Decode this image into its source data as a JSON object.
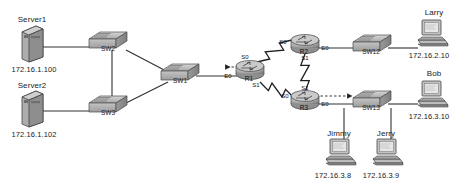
{
  "diagram": {
    "background_color": "#ffffff",
    "device_fill": "#b9b9b9",
    "device_stroke": "#4a4a4a",
    "link_color": "#303030"
  },
  "servers": [
    {
      "id": "server1",
      "name": "Server1",
      "ip": "172.16.1.100",
      "x": 32,
      "y": 44
    },
    {
      "id": "server2",
      "name": "Server2",
      "ip": "172.16.1.102",
      "x": 32,
      "y": 109
    }
  ],
  "switches": [
    {
      "id": "sw2",
      "name": "SW2",
      "x": 108,
      "y": 42
    },
    {
      "id": "sw3",
      "name": "SW3",
      "x": 108,
      "y": 106
    },
    {
      "id": "sw1",
      "name": "SW1",
      "x": 180,
      "y": 74
    },
    {
      "id": "sw12",
      "name": "SW12",
      "x": 372,
      "y": 45
    },
    {
      "id": "sw13",
      "name": "SW13",
      "x": 372,
      "y": 101
    }
  ],
  "routers": [
    {
      "id": "r1",
      "name": "R1",
      "x": 250,
      "y": 70,
      "interfaces": [
        {
          "name": "E0",
          "x": 228,
          "y": 76
        },
        {
          "name": "S0",
          "x": 245,
          "y": 57
        },
        {
          "name": "S1",
          "x": 256,
          "y": 85
        }
      ]
    },
    {
      "id": "r2",
      "name": "R2",
      "x": 305,
      "y": 44,
      "interfaces": [
        {
          "name": "S0",
          "x": 283,
          "y": 42
        },
        {
          "name": "E0",
          "x": 325,
          "y": 48
        },
        {
          "name": "S1",
          "x": 305,
          "y": 58
        }
      ]
    },
    {
      "id": "r3",
      "name": "R3",
      "x": 305,
      "y": 100,
      "interfaces": [
        {
          "name": "S1",
          "x": 305,
          "y": 88
        },
        {
          "name": "S0",
          "x": 285,
          "y": 96
        },
        {
          "name": "E0",
          "x": 325,
          "y": 104
        }
      ]
    }
  ],
  "hosts": [
    {
      "id": "larry",
      "name": "Larry",
      "ip": "172.16.2.10",
      "x": 432,
      "y": 33
    },
    {
      "id": "bob",
      "name": "Bob",
      "ip": "172.16.3.10",
      "x": 432,
      "y": 94
    },
    {
      "id": "jimmy",
      "name": "Jimmy",
      "ip": "172.16.3.8",
      "x": 340,
      "y": 152
    },
    {
      "id": "jerry",
      "name": "Jerry",
      "ip": "172.16.3.9",
      "x": 387,
      "y": 152
    }
  ],
  "ethernet_links": [
    {
      "from": "server1",
      "to": "sw2",
      "x1": 40,
      "y1": 47,
      "x2": 92,
      "y2": 47
    },
    {
      "from": "server2",
      "to": "sw3",
      "x1": 40,
      "y1": 111,
      "x2": 92,
      "y2": 111
    },
    {
      "from": "sw2",
      "to": "sw3",
      "x1": 112,
      "y1": 50,
      "x2": 112,
      "y2": 101
    },
    {
      "from": "sw2",
      "to": "sw1",
      "x1": 126,
      "y1": 50,
      "x2": 168,
      "y2": 72
    },
    {
      "from": "sw3",
      "to": "sw1",
      "x1": 126,
      "y1": 103,
      "x2": 168,
      "y2": 82
    },
    {
      "from": "sw1",
      "to": "r1",
      "x1": 196,
      "y1": 76,
      "x2": 237,
      "y2": 76
    },
    {
      "from": "r2",
      "to": "sw12",
      "x1": 318,
      "y1": 48,
      "x2": 356,
      "y2": 48
    },
    {
      "from": "r3",
      "to": "sw13",
      "x1": 318,
      "y1": 104,
      "x2": 356,
      "y2": 104
    },
    {
      "from": "sw12",
      "to": "larry",
      "x1": 388,
      "y1": 48,
      "x2": 418,
      "y2": 48
    },
    {
      "from": "sw13",
      "to": "bob",
      "x1": 388,
      "y1": 104,
      "x2": 418,
      "y2": 104
    },
    {
      "from": "sw13",
      "to": "jimmy",
      "x1": 344,
      "y1": 108,
      "x2": 344,
      "y2": 140
    },
    {
      "from": "sw13",
      "to": "jerry",
      "x1": 391,
      "y1": 108,
      "x2": 391,
      "y2": 140
    }
  ],
  "serial_links": [
    {
      "from": "r1",
      "from_if": "S0",
      "to": "r2",
      "to_if": "S0",
      "x1": 257,
      "y1": 62,
      "x2": 292,
      "y2": 40
    },
    {
      "from": "r1",
      "from_if": "S1",
      "to": "r3",
      "to_if": "S0",
      "x1": 260,
      "y1": 82,
      "x2": 294,
      "y2": 98
    },
    {
      "from": "r2",
      "from_if": "S1",
      "to": "r3",
      "to_if": "S1",
      "x1": 305,
      "y1": 54,
      "x2": 305,
      "y2": 92
    }
  ],
  "annotations": [
    {
      "id": "arrow-r1-left",
      "type": "dashed-arrow",
      "direction": "left",
      "x1": 243,
      "y1": 67,
      "x2": 226,
      "y2": 67
    },
    {
      "id": "arrow-r3-right",
      "type": "dashed-arrow",
      "direction": "right",
      "x1": 316,
      "y1": 96,
      "x2": 348,
      "y2": 96
    }
  ]
}
